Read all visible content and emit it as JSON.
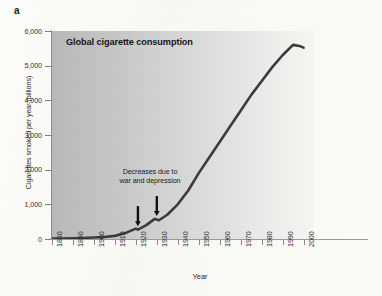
{
  "panel": {
    "label": "a"
  },
  "chart_data": {
    "type": "line",
    "title": "Global cigarette consumption",
    "xlabel": "Year",
    "ylabel": "Cigarettes smoked per year (billions)",
    "xlim": [
      1880,
      2005
    ],
    "ylim": [
      0,
      6000
    ],
    "grid": false,
    "legend": "none",
    "xtick_labels": [
      "1880",
      "1890",
      "1900",
      "1910",
      "1920",
      "1930",
      "1940",
      "1950",
      "1960",
      "1970",
      "1980",
      "1990",
      "2000"
    ],
    "xticks": [
      1880,
      1890,
      1900,
      1910,
      1920,
      1930,
      1940,
      1950,
      1960,
      1970,
      1980,
      1990,
      2000
    ],
    "ytick_labels": [
      "0",
      "1,000",
      "2,000",
      "3,000",
      "4,000",
      "5,000",
      "6,000"
    ],
    "yticks": [
      0,
      1000,
      2000,
      3000,
      4000,
      5000,
      6000
    ],
    "series": [
      {
        "name": "Global cigarette consumption",
        "color": "#3b3b3b",
        "x": [
          1880,
          1885,
          1890,
          1895,
          1900,
          1905,
          1910,
          1915,
          1918,
          1920,
          1921,
          1925,
          1929,
          1930,
          1931,
          1935,
          1940,
          1945,
          1950,
          1955,
          1960,
          1965,
          1970,
          1975,
          1980,
          1985,
          1990,
          1995,
          1998,
          2000
        ],
        "values": [
          10,
          15,
          20,
          30,
          45,
          60,
          90,
          170,
          250,
          300,
          270,
          400,
          580,
          560,
          540,
          700,
          1000,
          1400,
          1900,
          2350,
          2800,
          3250,
          3700,
          4150,
          4550,
          4950,
          5300,
          5600,
          5570,
          5520
        ]
      }
    ],
    "annotations": [
      {
        "name": "decreases-note",
        "text": "Decreases due to war and depression",
        "text_lines": [
          "Decreases due to",
          "war and depression"
        ],
        "arrows": [
          {
            "name": "arrow-1920",
            "points_to_year": 1921,
            "points_to_value": 270
          },
          {
            "name": "arrow-1930",
            "points_to_year": 1930,
            "points_to_value": 560
          }
        ]
      }
    ],
    "background": {
      "gradient_from": "#b9b9b9",
      "gradient_to": "#f7f7f6",
      "direction": "left-to-right"
    }
  }
}
